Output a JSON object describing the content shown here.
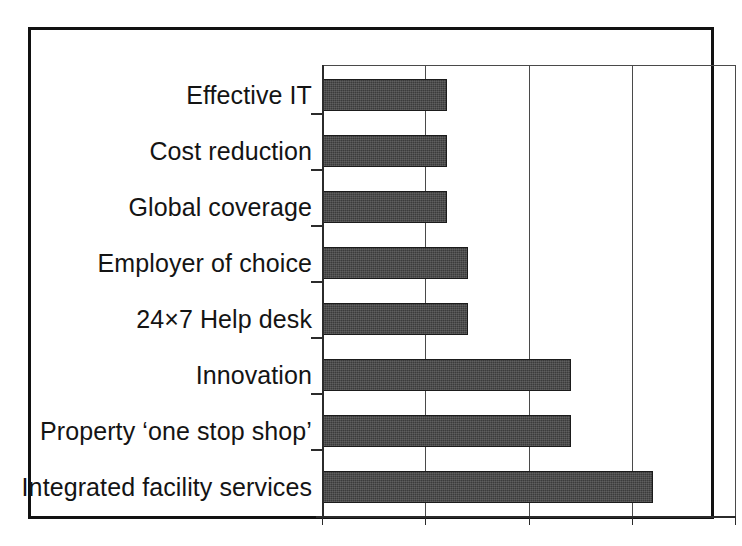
{
  "chart_data": {
    "type": "bar",
    "orientation": "horizontal",
    "title": "",
    "subtitle": "",
    "xlabel": "",
    "ylabel": "",
    "categories": [
      "Effective IT",
      "Cost reduction",
      "Global coverage",
      "Employer of choice",
      "24×7 Help desk",
      "Innovation",
      "Property ‘one stop shop’",
      "Integrated facility services"
    ],
    "values": [
      6,
      6,
      6,
      7,
      7,
      12,
      12,
      16
    ],
    "xlim": [
      0,
      20
    ],
    "xticks": [
      0,
      5,
      10,
      15,
      20
    ],
    "xtick_labels": [
      "0",
      "5",
      "10",
      "15",
      "20"
    ],
    "grid": "vertical gridlines at 5, 10, 15, 20",
    "legend": "none",
    "bar_color": "#3b3b3b",
    "bar_edge_color": "#1b1b1b",
    "axis_color": "#2b2b2b",
    "gridline_color": "#4a4a4a",
    "frame_color": "#111111",
    "background_color": "#ffffff",
    "text_color": "#141414"
  }
}
